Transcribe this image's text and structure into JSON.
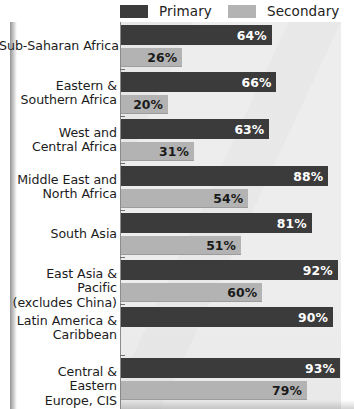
{
  "chart_data": {
    "type": "bar",
    "orientation": "horizontal",
    "title": "",
    "xlabel": "",
    "ylabel": "",
    "xlim": [
      0,
      100
    ],
    "grid": false,
    "legend_position": "top",
    "value_suffix": "%",
    "categories": [
      "Sub-Saharan Africa",
      "Eastern &\nSouthern Africa",
      "West and\nCentral Africa",
      "Middle East and\nNorth Africa",
      "South Asia",
      "East Asia & Pacific\n(excludes China)",
      "Latin America &\nCaribbean",
      "Central & Eastern\nEurope, CIS"
    ],
    "series": [
      {
        "name": "Primary",
        "color": "#3b3b3b",
        "values": [
          64,
          66,
          63,
          88,
          81,
          92,
          90,
          93
        ],
        "labels": [
          "64%",
          "66%",
          "63%",
          "88%",
          "81%",
          "92%",
          "90%",
          "93%"
        ]
      },
      {
        "name": "Secondary",
        "color": "#b3b3b3",
        "values": [
          26,
          20,
          31,
          54,
          51,
          60,
          null,
          79
        ],
        "labels": [
          "26%",
          "20%",
          "31%",
          "54%",
          "51%",
          "60%",
          "",
          "79%"
        ]
      }
    ]
  },
  "legend": {
    "primary": {
      "label": "Primary",
      "color": "#3b3b3b"
    },
    "secondary": {
      "label": "Secondary",
      "color": "#b3b3b3"
    }
  },
  "rows": [
    {
      "label": "Sub-Saharan Africa",
      "primary": "64%",
      "secondary": "26%"
    },
    {
      "label": "Eastern &\nSouthern Africa",
      "primary": "66%",
      "secondary": "20%"
    },
    {
      "label": "West and\nCentral Africa",
      "primary": "63%",
      "secondary": "31%"
    },
    {
      "label": "Middle East and\nNorth Africa",
      "primary": "88%",
      "secondary": "54%"
    },
    {
      "label": "South Asia",
      "primary": "81%",
      "secondary": "51%"
    },
    {
      "label": "East Asia & Pacific\n(excludes China)",
      "primary": "92%",
      "secondary": "60%"
    },
    {
      "label": "Latin America &\nCaribbean",
      "primary": "90%",
      "secondary": ""
    },
    {
      "label": "Central & Eastern\nEurope, CIS",
      "primary": "93%",
      "secondary": "79%"
    }
  ]
}
